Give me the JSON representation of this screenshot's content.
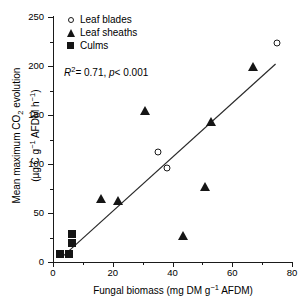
{
  "chart_data": {
    "type": "scatter",
    "title": "",
    "xlabel": "Fungal biomass (mg DM g⁻¹ AFDM)",
    "ylabel": "Mean maximum CO₂ evolution (µg C g⁻¹ AFDM h⁻¹)",
    "xlim": [
      0,
      80
    ],
    "ylim": [
      0,
      250
    ],
    "xticks": [
      0,
      20,
      40,
      60,
      80
    ],
    "xticks_minor": [
      10,
      30,
      50,
      70
    ],
    "yticks": [
      0,
      50,
      100,
      150,
      200,
      250
    ],
    "yticks_minor": [
      25,
      75,
      125,
      175,
      225
    ],
    "grid": false,
    "legend_position": "top-left",
    "series": [
      {
        "name": "Leaf blades",
        "marker": "open-circle",
        "points": [
          {
            "x": 35.0,
            "y": 112
          },
          {
            "x": 38.0,
            "y": 96
          },
          {
            "x": 75.0,
            "y": 223
          }
        ]
      },
      {
        "name": "Leaf sheaths",
        "marker": "filled-triangle",
        "points": [
          {
            "x": 16.0,
            "y": 64
          },
          {
            "x": 21.8,
            "y": 62
          },
          {
            "x": 30.8,
            "y": 154
          },
          {
            "x": 43.5,
            "y": 27
          },
          {
            "x": 51.0,
            "y": 77
          },
          {
            "x": 53.0,
            "y": 143
          },
          {
            "x": 67.0,
            "y": 199
          }
        ]
      },
      {
        "name": "Culms",
        "marker": "filled-square",
        "points": [
          {
            "x": 2.2,
            "y": 8
          },
          {
            "x": 5.2,
            "y": 8
          },
          {
            "x": 6.3,
            "y": 19
          },
          {
            "x": 6.4,
            "y": 29
          }
        ]
      }
    ],
    "regression": {
      "x_start": 3.0,
      "y_start": 5,
      "x_end": 74.5,
      "y_end": 202,
      "r_squared": "0.71",
      "p_value": "<0.001"
    },
    "annotations": {
      "stats_r2_symbol": "R",
      "stats_r2_exponent": "2",
      "stats_r2_value": "= 0.71,",
      "stats_p_symbol": "p",
      "stats_p_value": "< 0.001"
    }
  },
  "axes": {
    "x": {
      "label_main": "Fungal biomass (mg DM g",
      "label_sup": "−1",
      "label_tail": " AFDM)",
      "tick_labels": [
        "0",
        "20",
        "40",
        "60",
        "80"
      ]
    },
    "y": {
      "line1_a": "Mean maximum CO",
      "line1_sub": "2",
      "line1_b": " evolution",
      "line2_a": "(µg C g",
      "line2_sup1": "−1",
      "line2_b": " AFDM h",
      "line2_sup2": "−1",
      "line2_c": ")",
      "tick_labels": [
        "0",
        "50",
        "100",
        "150",
        "200",
        "250"
      ]
    }
  },
  "legend": {
    "items": [
      {
        "label": "Leaf blades",
        "marker": "open-circle-icon"
      },
      {
        "label": "Leaf sheaths",
        "marker": "filled-triangle-icon"
      },
      {
        "label": "Culms",
        "marker": "filled-square-icon"
      }
    ]
  },
  "colors": {
    "marker": "#151515",
    "axis": "#1a1a1a",
    "line": "#2a2a2a",
    "background": "#ffffff"
  }
}
